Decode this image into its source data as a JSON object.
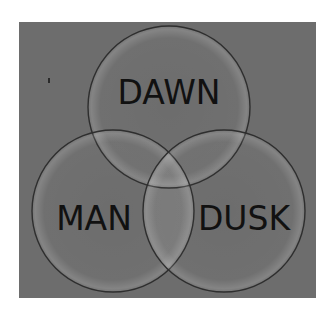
{
  "diagram": {
    "type": "venn",
    "background_color": "#6d6d6d",
    "page_color": "#ffffff",
    "circle_stroke_color": "#2e2e2e",
    "circles": [
      {
        "id": "dawn",
        "label": "DAWN",
        "cx": 169,
        "cy": 107,
        "r": 81
      },
      {
        "id": "man",
        "label": "MAN",
        "cx": 113,
        "cy": 211,
        "r": 81
      },
      {
        "id": "dusk",
        "label": "DUSK",
        "cx": 224,
        "cy": 211,
        "r": 81
      }
    ]
  }
}
